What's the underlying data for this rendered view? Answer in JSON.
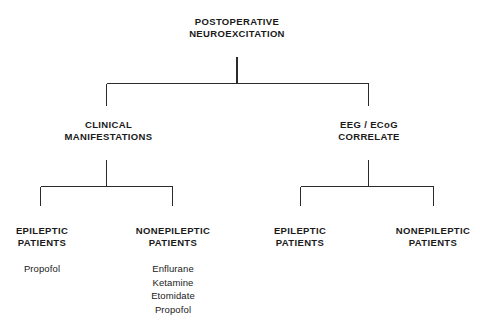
{
  "diagram": {
    "type": "hierarchy-tree",
    "orientation": "top-down",
    "line_color": "#2b2b2b",
    "background_color": "#ffffff",
    "root": {
      "line1": "POSTOPERATIVE",
      "line2": "NEUROEXCITATION"
    },
    "branches": [
      {
        "id": "clinical-manifestations",
        "line1": "CLINICAL",
        "line2": "MANIFESTATIONS"
      },
      {
        "id": "eeg-ecog-correlate",
        "line1": "EEG / ECoG",
        "line2": "CORRELATE"
      }
    ],
    "leaves": [
      {
        "id": "clinical-epileptic",
        "line1": "EPILEPTIC",
        "line2": "PATIENTS",
        "drugs": [
          "Propofol"
        ]
      },
      {
        "id": "clinical-nonepileptic",
        "line1": "NONEPILEPTIC",
        "line2": "PATIENTS",
        "drugs": [
          "Enflurane",
          "Ketamine",
          "Etomidate",
          "Propofol"
        ]
      },
      {
        "id": "eeg-epileptic",
        "line1": "EPILEPTIC",
        "line2": "PATIENTS",
        "drugs": []
      },
      {
        "id": "eeg-nonepileptic",
        "line1": "NONEPILEPTIC",
        "line2": "PATIENTS",
        "drugs": []
      }
    ]
  }
}
